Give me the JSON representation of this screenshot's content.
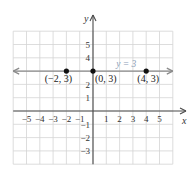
{
  "chart_data": {
    "type": "line",
    "title": "",
    "xlabel": "x",
    "ylabel": "y",
    "xlim": [
      -6,
      6
    ],
    "ylim": [
      -4,
      6
    ],
    "grid": true,
    "x_ticks": [
      "−5",
      "−4",
      "−3",
      "−2",
      "−1",
      "1",
      "2",
      "3",
      "4",
      "5"
    ],
    "x_tick_values": [
      -5,
      -4,
      -3,
      -2,
      -1,
      1,
      2,
      3,
      4,
      5
    ],
    "y_ticks": [
      "5",
      "4",
      "2",
      "1",
      "−1",
      "−2",
      "−3"
    ],
    "y_tick_values": [
      5,
      4,
      2,
      1,
      -1,
      -2,
      -3
    ],
    "series": [
      {
        "name": "y = 3",
        "equation": "y = 3",
        "kind": "horizontal line",
        "x": [
          -6,
          6
        ],
        "y": [
          3,
          3
        ]
      }
    ],
    "points": [
      {
        "x": -2,
        "y": 3,
        "label": "(−2, 3)"
      },
      {
        "x": 0,
        "y": 3,
        "label": "(0, 3)"
      },
      {
        "x": 4,
        "y": 3,
        "label": "(4, 3)"
      }
    ],
    "annotations": [
      "y = 3"
    ]
  },
  "colors": {
    "grid": "#d4d4d4",
    "axis": "#4a4a4a",
    "line": "#8a8a8a",
    "line_label": "#8ca0b8",
    "point": "#111111"
  }
}
